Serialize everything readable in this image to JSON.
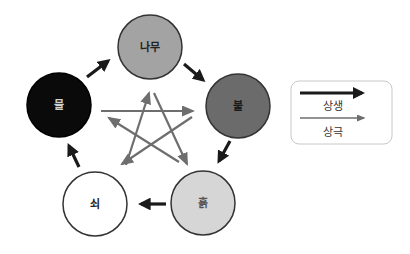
{
  "diagram": {
    "type": "five-elements-cycle",
    "nodes": [
      {
        "id": "wood",
        "label": "나무",
        "fill": "#a3a3a3",
        "text_color": "#222222",
        "cx": 150,
        "cy": 47
      },
      {
        "id": "fire",
        "label": "불",
        "fill": "#6b6b6b",
        "text_color": "#1a1a1a",
        "cx": 238,
        "cy": 105
      },
      {
        "id": "earth",
        "label": "흙",
        "fill": "#d6d6d6",
        "text_color": "#555555",
        "cx": 203,
        "cy": 203
      },
      {
        "id": "metal",
        "label": "쇠",
        "fill": "#ffffff",
        "text_color": "#222222",
        "cx": 95,
        "cy": 204
      },
      {
        "id": "water",
        "label": "물",
        "fill": "#0a0a0a",
        "text_color": "#cfcfcf",
        "cx": 59,
        "cy": 105
      }
    ],
    "generating_edges": [
      {
        "from": "wood",
        "to": "fire"
      },
      {
        "from": "fire",
        "to": "earth"
      },
      {
        "from": "earth",
        "to": "metal"
      },
      {
        "from": "metal",
        "to": "water"
      },
      {
        "from": "water",
        "to": "wood"
      }
    ],
    "overcoming_edges": [
      {
        "from": "wood",
        "to": "earth"
      },
      {
        "from": "earth",
        "to": "water"
      },
      {
        "from": "water",
        "to": "fire"
      },
      {
        "from": "fire",
        "to": "metal"
      },
      {
        "from": "metal",
        "to": "wood"
      }
    ],
    "colors": {
      "generating_arrow": "#1a1a1a",
      "overcoming_arrow": "#6e6e6e",
      "node_stroke": "#333333"
    }
  },
  "legend": {
    "items": [
      {
        "label": "상생",
        "style": "thick-black-arrow"
      },
      {
        "label": "상극",
        "style": "thin-gray-arrow"
      }
    ]
  }
}
